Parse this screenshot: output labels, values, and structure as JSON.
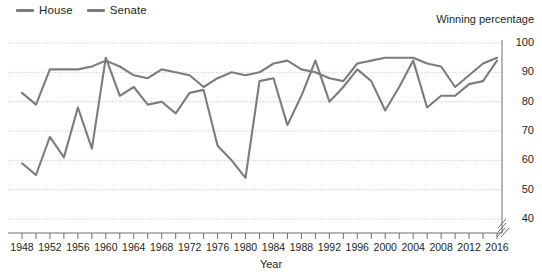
{
  "legend": {
    "position": "top-left",
    "entries": [
      {
        "label": "House",
        "color": "#7c7c7c"
      },
      {
        "label": "Senate",
        "color": "#7c7c7c"
      }
    ]
  },
  "axes": {
    "y_title": "Winning percentage",
    "x_title": "Year",
    "y_ticks": [
      100,
      90,
      80,
      70,
      60,
      50,
      40
    ],
    "y_axis_broken": true,
    "x_labels": [
      1948,
      1952,
      1956,
      1960,
      1964,
      1968,
      1972,
      1976,
      1980,
      1984,
      1988,
      1992,
      1996,
      2000,
      2004,
      2008,
      2012,
      2016
    ],
    "x_minor_step_years": 2,
    "x_axis_broken": true
  },
  "chart_data": {
    "type": "line",
    "title": "",
    "subtitle": "",
    "xlabel": "Year",
    "ylabel": "Winning percentage",
    "xlim": [
      1947,
      2017
    ],
    "ylim": [
      36,
      100
    ],
    "grid": true,
    "legend_position": "top-left",
    "x": [
      1948,
      1950,
      1952,
      1954,
      1956,
      1958,
      1960,
      1962,
      1964,
      1966,
      1968,
      1970,
      1972,
      1974,
      1976,
      1978,
      1980,
      1982,
      1984,
      1986,
      1988,
      1990,
      1992,
      1994,
      1996,
      1998,
      2000,
      2002,
      2004,
      2006,
      2008,
      2010,
      2012,
      2014,
      2016
    ],
    "series": [
      {
        "name": "House",
        "color": "#7c7c7c",
        "values": [
          83,
          79,
          91,
          91,
          91,
          92,
          94,
          92,
          89,
          88,
          91,
          90,
          89,
          85,
          88,
          90,
          89,
          90,
          93,
          94,
          91,
          90,
          88,
          87,
          93,
          94,
          95,
          95,
          95,
          93,
          92,
          85,
          89,
          93,
          95
        ]
      },
      {
        "name": "Senate",
        "color": "#7c7c7c",
        "values": [
          59,
          55,
          68,
          61,
          78,
          64,
          95,
          82,
          85,
          79,
          80,
          76,
          83,
          84,
          65,
          60,
          54,
          87,
          88,
          72,
          82,
          94,
          80,
          85,
          91,
          87,
          77,
          85,
          94,
          78,
          82,
          82,
          86,
          87,
          94
        ]
      }
    ],
    "annotations": []
  }
}
